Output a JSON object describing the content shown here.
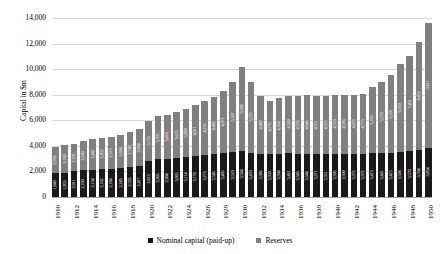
{
  "chart_data": {
    "type": "bar",
    "title": "",
    "xlabel": "",
    "ylabel": "Capital in $m",
    "ylim": [
      0,
      14000
    ],
    "ytick_labels": [
      "14,000",
      "12,000",
      "10,000",
      "8,000",
      "6,000",
      "4,000",
      "2,000",
      "0"
    ],
    "ytick_values": [
      14000,
      12000,
      10000,
      8000,
      6000,
      4000,
      2000,
      0
    ],
    "grid": true,
    "stacked": true,
    "legend_position": "bottom",
    "legend": [
      "Nominal capital (paid-up)",
      "Reserves"
    ],
    "categories": [
      "1910",
      "1911",
      "1912",
      "1913",
      "1914",
      "1915",
      "1916",
      "1917",
      "1918",
      "1919",
      "1920",
      "1921",
      "1922",
      "1923",
      "1924",
      "1925",
      "1926",
      "1927",
      "1928",
      "1929",
      "1930",
      "1931",
      "1932",
      "1933",
      "1934",
      "1935",
      "1936",
      "1937",
      "1938",
      "1939",
      "1940",
      "1941",
      "1942",
      "1943",
      "1944",
      "1945",
      "1946",
      "1947",
      "1948",
      "1949",
      "1950"
    ],
    "category_tick_labels": [
      "1910",
      "",
      "1912",
      "",
      "1914",
      "",
      "1916",
      "",
      "1918",
      "",
      "1920",
      "",
      "1922",
      "",
      "1924",
      "",
      "1926",
      "",
      "1928",
      "",
      "1930",
      "",
      "1932",
      "",
      "1934",
      "",
      "1936",
      "",
      "1938",
      "",
      "1940",
      "",
      "1942",
      "",
      "1944",
      "",
      "1946",
      "",
      "1948",
      "",
      "1950"
    ],
    "series": [
      {
        "name": "Nominal capital (paid-up)",
        "color": "#1a1a1a",
        "values": [
          1840,
          1853,
          2011,
          2109,
          2134,
          2162,
          2184,
          2243,
          2335,
          2417,
          2813,
          2965,
          2994,
          3065,
          3114,
          3170,
          3273,
          3346,
          3405,
          3510,
          3584,
          3470,
          3386,
          3350,
          3394,
          3421,
          3343,
          3344,
          3371,
          3351,
          3395,
          3390,
          3372,
          3372,
          3413,
          3441,
          3415,
          3508,
          3570,
          3704,
          3834
        ]
      },
      {
        "name": "Reserves",
        "color": "#808080",
        "values": [
          2036,
          2180,
          2105,
          2249,
          2442,
          2453,
          2513,
          2609,
          2740,
          2894,
          3153,
          3355,
          3410,
          3615,
          3809,
          4011,
          4233,
          4486,
          4872,
          5507,
          6608,
          5535,
          4480,
          4176,
          4350,
          4509,
          4536,
          4646,
          4551,
          4553,
          4570,
          4586,
          4633,
          4713,
          5163,
          5579,
          6101,
          6910,
          7451,
          8453,
          9811
        ]
      }
    ],
    "totals": [
      3876,
      4033,
      4116,
      4358,
      4576,
      4615,
      4697,
      4852,
      5075,
      5311,
      5966,
      6320,
      6404,
      6680,
      6923,
      7181,
      7506,
      7832,
      8277,
      9017,
      10192,
      9005,
      7866,
      7526,
      7744,
      7930,
      7879,
      7990,
      7922,
      7904,
      7965,
      7976,
      8005,
      8085,
      8576,
      9020,
      9516,
      10418,
      11021,
      12157,
      13645
    ]
  }
}
